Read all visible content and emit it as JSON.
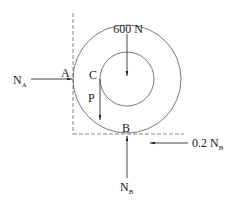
{
  "diagram": {
    "type": "free-body-diagram",
    "points": {
      "A": "A",
      "B": "B",
      "C": "C"
    },
    "forces": {
      "weight": {
        "label": "600 N",
        "direction": "down"
      },
      "applied": {
        "label": "P",
        "direction": "down"
      },
      "normal_A": {
        "label_main": "N",
        "label_sub": "A",
        "direction": "right"
      },
      "normal_B": {
        "label_main": "N",
        "label_sub": "B",
        "direction": "up"
      },
      "friction_B": {
        "label_main": "0.2 N",
        "label_sub": "B",
        "direction": "left"
      }
    },
    "colors": {
      "line": "#1a1a1a",
      "circle": "#555555",
      "dashed": "#666666"
    }
  }
}
